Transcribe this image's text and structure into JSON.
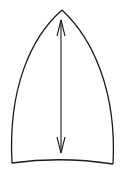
{
  "diagram": {
    "colors": {
      "background": "#ffffff",
      "stroke": "#1a1a1a"
    },
    "shape": {
      "apex": [
        62,
        10
      ],
      "bottom_left": [
        12,
        163
      ],
      "bottom_right": [
        113,
        164
      ]
    },
    "arrow": {
      "type": "double-headed",
      "top": [
        61,
        20
      ],
      "bottom": [
        61,
        153
      ]
    }
  }
}
